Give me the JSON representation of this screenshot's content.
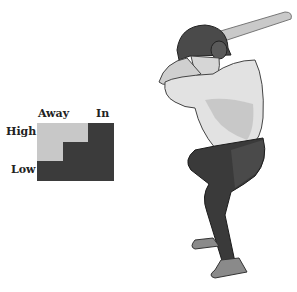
{
  "strike_zone": {
    "column_labels": {
      "away": "Away",
      "in": "In"
    },
    "row_labels": {
      "high": "High",
      "low": "Low"
    },
    "colors": {
      "hot": "#c8c8c8",
      "cold": "#3b3b3b"
    }
  }
}
